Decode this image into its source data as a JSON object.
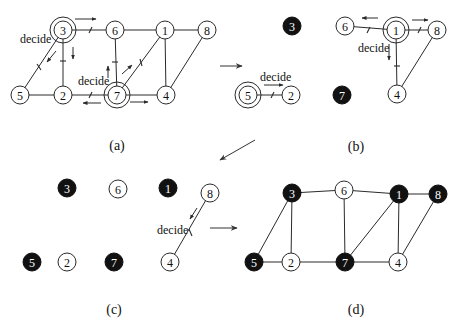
{
  "figure": {
    "panels": [
      {
        "id": "a",
        "caption": "(a)",
        "nodes": [
          {
            "label": "3",
            "x": 63,
            "y": 30,
            "state": "deciding"
          },
          {
            "label": "6",
            "x": 115,
            "y": 30,
            "state": "undecided"
          },
          {
            "label": "1",
            "x": 165,
            "y": 30,
            "state": "undecided"
          },
          {
            "label": "8",
            "x": 207,
            "y": 30,
            "state": "undecided"
          },
          {
            "label": "5",
            "x": 20,
            "y": 95,
            "state": "undecided"
          },
          {
            "label": "2",
            "x": 63,
            "y": 95,
            "state": "undecided"
          },
          {
            "label": "7",
            "x": 117,
            "y": 95,
            "state": "deciding"
          },
          {
            "label": "4",
            "x": 166,
            "y": 95,
            "state": "undecided"
          }
        ],
        "edges": [
          [
            "3",
            "6"
          ],
          [
            "6",
            "1"
          ],
          [
            "1",
            "8"
          ],
          [
            "3",
            "5"
          ],
          [
            "3",
            "2"
          ],
          [
            "5",
            "2"
          ],
          [
            "2",
            "7"
          ],
          [
            "7",
            "6"
          ],
          [
            "7",
            "1"
          ],
          [
            "7",
            "4"
          ],
          [
            "1",
            "4"
          ],
          [
            "8",
            "4"
          ]
        ],
        "decide_labels": [
          {
            "text": "decide",
            "x": 20,
            "y": 43
          },
          {
            "text": "decide",
            "x": 78,
            "y": 85
          }
        ]
      },
      {
        "id": "b",
        "caption": "(b)",
        "nodes": [
          {
            "label": "3",
            "x": 292,
            "y": 26,
            "state": "in-set"
          },
          {
            "label": "6",
            "x": 345,
            "y": 26,
            "state": "undecided"
          },
          {
            "label": "1",
            "x": 396,
            "y": 30,
            "state": "deciding"
          },
          {
            "label": "8",
            "x": 437,
            "y": 30,
            "state": "undecided"
          },
          {
            "label": "5",
            "x": 248,
            "y": 95,
            "state": "deciding"
          },
          {
            "label": "2",
            "x": 291,
            "y": 95,
            "state": "undecided"
          },
          {
            "label": "7",
            "x": 342,
            "y": 95,
            "state": "in-set"
          },
          {
            "label": "4",
            "x": 397,
            "y": 94,
            "state": "undecided"
          }
        ],
        "edges": [
          [
            "6",
            "1"
          ],
          [
            "1",
            "8"
          ],
          [
            "1",
            "4"
          ],
          [
            "8",
            "4"
          ],
          [
            "5",
            "2"
          ]
        ],
        "decide_labels": [
          {
            "text": "decide",
            "x": 358,
            "y": 52
          },
          {
            "text": "decide",
            "x": 260,
            "y": 81
          }
        ]
      },
      {
        "id": "c",
        "caption": "(c)",
        "nodes": [
          {
            "label": "3",
            "x": 67,
            "y": 188,
            "state": "in-set"
          },
          {
            "label": "6",
            "x": 118,
            "y": 189,
            "state": "undecided"
          },
          {
            "label": "1",
            "x": 168,
            "y": 188,
            "state": "in-set"
          },
          {
            "label": "8",
            "x": 210,
            "y": 193,
            "state": "undecided"
          },
          {
            "label": "5",
            "x": 32,
            "y": 262,
            "state": "in-set"
          },
          {
            "label": "2",
            "x": 67,
            "y": 262,
            "state": "undecided"
          },
          {
            "label": "7",
            "x": 114,
            "y": 262,
            "state": "in-set"
          },
          {
            "label": "4",
            "x": 170,
            "y": 262,
            "state": "undecided"
          }
        ],
        "edges": [
          [
            "8",
            "4"
          ]
        ],
        "decide_labels": [
          {
            "text": "decide",
            "x": 157,
            "y": 234
          }
        ]
      },
      {
        "id": "d",
        "caption": "(d)",
        "nodes": [
          {
            "label": "3",
            "x": 292,
            "y": 193,
            "state": "in-set"
          },
          {
            "label": "6",
            "x": 344,
            "y": 190,
            "state": "undecided"
          },
          {
            "label": "1",
            "x": 399,
            "y": 194,
            "state": "in-set"
          },
          {
            "label": "8",
            "x": 438,
            "y": 194,
            "state": "in-set"
          },
          {
            "label": "5",
            "x": 254,
            "y": 262,
            "state": "in-set"
          },
          {
            "label": "2",
            "x": 291,
            "y": 262,
            "state": "undecided"
          },
          {
            "label": "7",
            "x": 345,
            "y": 262,
            "state": "in-set"
          },
          {
            "label": "4",
            "x": 398,
            "y": 262,
            "state": "undecided"
          }
        ],
        "edges": [
          [
            "3",
            "6"
          ],
          [
            "6",
            "1"
          ],
          [
            "1",
            "8"
          ],
          [
            "3",
            "5"
          ],
          [
            "3",
            "2"
          ],
          [
            "5",
            "2"
          ],
          [
            "2",
            "7"
          ],
          [
            "7",
            "6"
          ],
          [
            "7",
            "1"
          ],
          [
            "7",
            "4"
          ],
          [
            "1",
            "4"
          ],
          [
            "8",
            "4"
          ]
        ],
        "decide_labels": []
      }
    ],
    "transition_arrows": [
      {
        "from": "a",
        "to": "b",
        "icon": "right-arrow-icon"
      },
      {
        "from": "b",
        "to": "c",
        "icon": "down-left-arrow-icon"
      },
      {
        "from": "c",
        "to": "d",
        "icon": "right-arrow-icon"
      }
    ],
    "colors": {
      "in_set_fill": "#111111",
      "node_stroke": "#2a2a2a",
      "background": "#ffffff"
    }
  }
}
